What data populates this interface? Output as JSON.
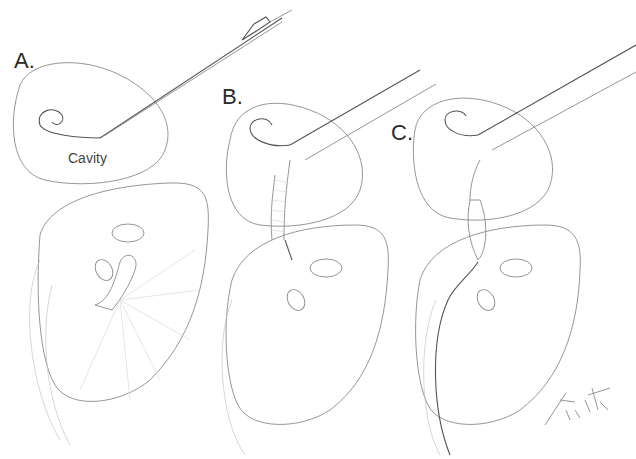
{
  "figure": {
    "panels": [
      {
        "id": "A",
        "label": "A.",
        "annotation": "Cavity"
      },
      {
        "id": "B",
        "label": "B."
      },
      {
        "id": "C",
        "label": "C."
      }
    ],
    "signature": "Firth '24",
    "colors": {
      "background": "#ffffff",
      "line": "#8a8a8a",
      "dark_line": "#555555",
      "label": "#2a2a2a"
    }
  }
}
